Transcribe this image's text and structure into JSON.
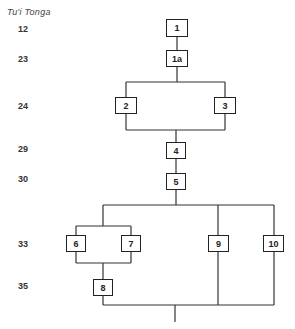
{
  "title": "Tu'i Tonga",
  "generations": [
    {
      "label": "12",
      "y": 24
    },
    {
      "label": "23",
      "y": 54
    },
    {
      "label": "24",
      "y": 101
    },
    {
      "label": "29",
      "y": 144
    },
    {
      "label": "30",
      "y": 174
    },
    {
      "label": "33",
      "y": 239
    },
    {
      "label": "35",
      "y": 281
    }
  ],
  "nodes": [
    {
      "id": "1",
      "label": "1",
      "x": 166,
      "y": 19,
      "w": 22,
      "h": 18
    },
    {
      "id": "1a",
      "label": "1a",
      "x": 166,
      "y": 50,
      "w": 22,
      "h": 17
    },
    {
      "id": "2",
      "label": "2",
      "x": 115,
      "y": 97,
      "w": 22,
      "h": 17
    },
    {
      "id": "3",
      "label": "3",
      "x": 214,
      "y": 97,
      "w": 22,
      "h": 17
    },
    {
      "id": "4",
      "label": "4",
      "x": 166,
      "y": 142,
      "w": 20,
      "h": 17
    },
    {
      "id": "5",
      "label": "5",
      "x": 166,
      "y": 173,
      "w": 20,
      "h": 17
    },
    {
      "id": "6",
      "label": "6",
      "x": 66,
      "y": 235,
      "w": 20,
      "h": 17
    },
    {
      "id": "7",
      "label": "7",
      "x": 121,
      "y": 235,
      "w": 20,
      "h": 17
    },
    {
      "id": "9",
      "label": "9",
      "x": 208,
      "y": 235,
      "w": 21,
      "h": 17
    },
    {
      "id": "10",
      "label": "10",
      "x": 263,
      "y": 235,
      "w": 21,
      "h": 17
    },
    {
      "id": "8",
      "label": "8",
      "x": 93,
      "y": 279,
      "w": 20,
      "h": 17
    }
  ]
}
